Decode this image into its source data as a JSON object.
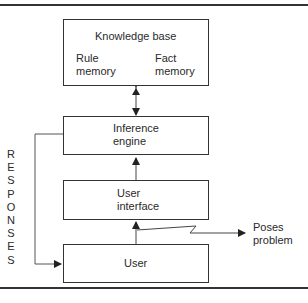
{
  "diagram": {
    "knowledge_base": {
      "title": "Knowledge base",
      "rule_memory": [
        "Rule",
        "memory"
      ],
      "fact_memory": [
        "Fact",
        "memory"
      ]
    },
    "inference_engine": [
      "Inference",
      "engine"
    ],
    "user_interface": [
      "User",
      "interface"
    ],
    "user": "User",
    "poses_problem": [
      "Poses",
      "problem"
    ],
    "responses_label": [
      "R",
      "E",
      "S",
      "P",
      "O",
      "N",
      "S",
      "E",
      "S"
    ]
  }
}
